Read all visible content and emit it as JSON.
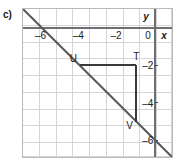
{
  "figure": {
    "part_label": "c)",
    "axis_names": {
      "x": "x",
      "y": "y"
    },
    "origin_label": "0"
  },
  "chart_data": {
    "type": "line",
    "title": "",
    "xlabel": "x",
    "ylabel": "y",
    "xlim": [
      -7,
      1
    ],
    "ylim": [
      -7,
      1
    ],
    "xticks": [
      -6,
      -4,
      -2,
      0
    ],
    "xtick_labels": [
      "–6",
      "–4",
      "–2",
      "0"
    ],
    "yticks": [
      -2,
      -4,
      -6
    ],
    "ytick_labels": [
      "–2",
      "–4",
      "–6"
    ],
    "grid": true,
    "grid_step": 1,
    "legend": "none",
    "series": [
      {
        "name": "line",
        "type": "line",
        "equation": "y = -x - 6",
        "slope": -1,
        "intercept": -6,
        "x": [
          -7.2,
          0.9
        ],
        "y": [
          1.2,
          -6.9
        ]
      },
      {
        "name": "rise-run-triangle",
        "type": "annotation",
        "points": [
          {
            "label": "U",
            "x": -4,
            "y": -2
          },
          {
            "label": "T",
            "x": -1,
            "y": -2
          },
          {
            "label": "V",
            "x": -1,
            "y": -5
          }
        ],
        "segments": [
          {
            "from": "U",
            "to": "T",
            "orientation": "horizontal"
          },
          {
            "from": "T",
            "to": "V",
            "orientation": "vertical"
          }
        ]
      }
    ],
    "point_labels": [
      "U",
      "T",
      "V"
    ]
  },
  "colors": {
    "grid": "#d5d5d7",
    "frame": "#b9b9bb",
    "axis": "#6f6f72",
    "line": "#58585b",
    "triangle": "#3a3a3d",
    "text": "#1a1a1a",
    "background": "#ffffff"
  }
}
